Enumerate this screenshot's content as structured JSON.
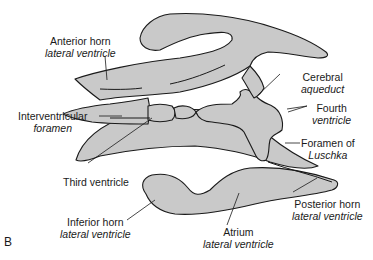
{
  "panel_letter": "B",
  "colors": {
    "fill": "#c9c9c9",
    "stroke": "#1a1a1a",
    "background": "#ffffff",
    "text": "#1a1a1a"
  },
  "labels": {
    "anterior_horn": {
      "main": "Anterior horn",
      "sub": "lateral ventricle"
    },
    "interventricular_foramen": {
      "main": "Interventricular",
      "sub": "foramen"
    },
    "third_ventricle": {
      "main": "Third ventricle"
    },
    "inferior_horn": {
      "main": "Inferior horn",
      "sub": "lateral ventricle"
    },
    "cerebral_aqueduct": {
      "main": "Cerebral",
      "sub": "aqueduct"
    },
    "fourth_ventricle": {
      "main": "Fourth",
      "sub": "ventricle"
    },
    "foramen_of_luschka": {
      "main": "Foramen of",
      "sub": "Luschka"
    },
    "posterior_horn": {
      "main": "Posterior horn",
      "sub": "lateral ventricle"
    },
    "atrium": {
      "main": "Atrium",
      "sub": "lateral ventricle"
    }
  }
}
